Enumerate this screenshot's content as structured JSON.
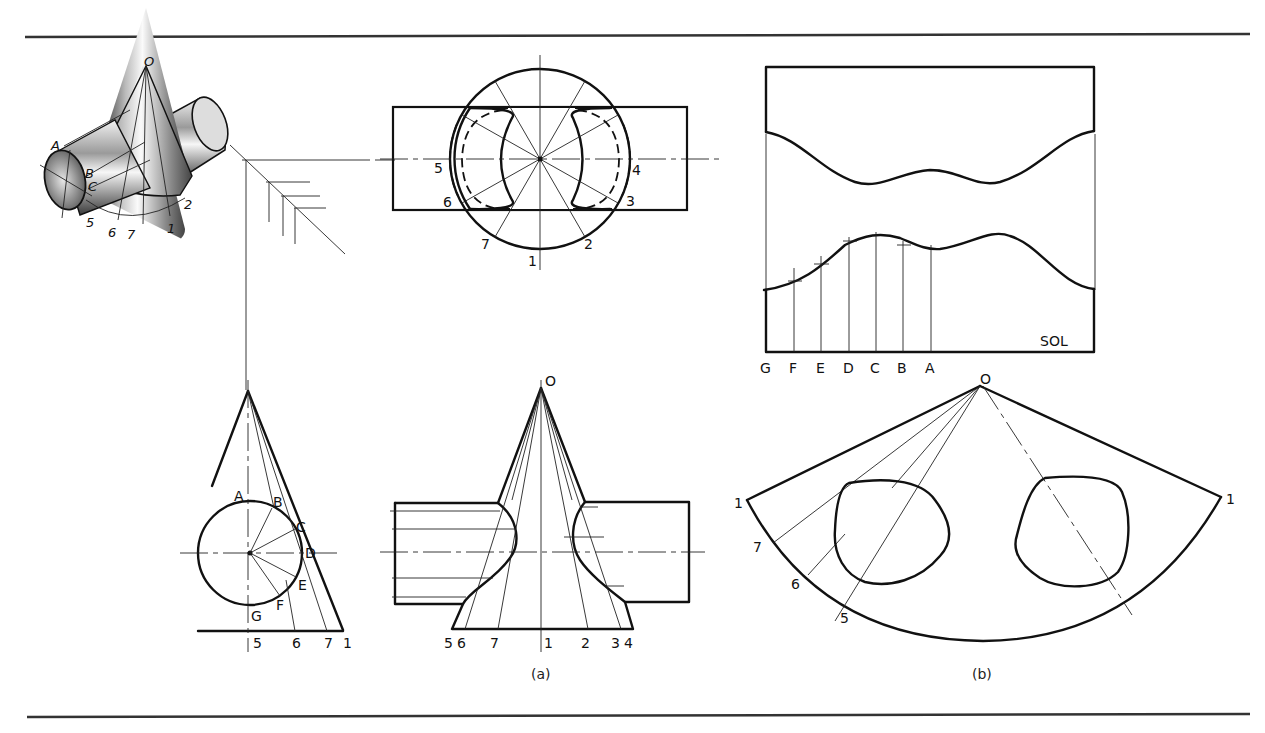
{
  "figure": {
    "captions": {
      "a": "(a)",
      "b": "(b)"
    },
    "pictorial": {
      "apex": "O",
      "letters": [
        "A",
        "B",
        "C"
      ],
      "numbers": [
        "5",
        "6",
        "7",
        "1",
        "2"
      ]
    },
    "top_view": {
      "numbers": {
        "n1": "1",
        "n2": "2",
        "n3": "3",
        "n4": "4",
        "n5": "5",
        "n6": "6",
        "n7": "7"
      }
    },
    "side_view": {
      "letters": {
        "A": "A",
        "B": "B",
        "C": "C",
        "D": "D",
        "E": "E",
        "F": "F",
        "G": "G"
      },
      "base_numbers": {
        "n5": "5",
        "n6": "6",
        "n7": "7",
        "n1": "1"
      }
    },
    "front_view": {
      "apex": "O",
      "base_numbers": {
        "n5": "5",
        "n6": "6",
        "n7": "7",
        "n1": "1",
        "n2": "2",
        "n3": "3",
        "n4": "4"
      }
    },
    "cylinder_development": {
      "stamp": "SOL",
      "stations": [
        "G",
        "F",
        "E",
        "D",
        "C",
        "B",
        "A"
      ]
    },
    "cone_development": {
      "apex": "O",
      "left_edge": "1",
      "right_edge": "1",
      "radial_numbers": {
        "n7": "7",
        "n6": "6",
        "n5": "5"
      }
    }
  }
}
